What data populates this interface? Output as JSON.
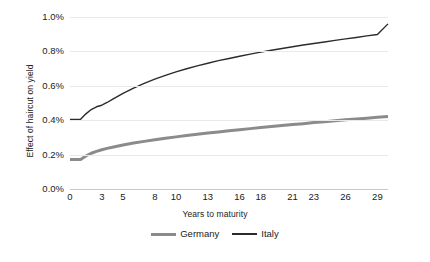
{
  "chart_data": {
    "type": "line",
    "title": "",
    "xlabel": "Years to maturity",
    "ylabel": "Effect of haircut on yield",
    "xlim": [
      0,
      30
    ],
    "ylim": [
      0,
      0.01
    ],
    "grid": true,
    "legend_position": "bottom-center",
    "xticks": [
      "0",
      "3",
      "5",
      "8",
      "10",
      "13",
      "16",
      "18",
      "21",
      "23",
      "26",
      "29"
    ],
    "xtick_values": [
      0,
      3,
      5,
      8,
      10,
      13,
      16,
      18,
      21,
      23,
      26,
      29
    ],
    "yticks": [
      "0.0%",
      "0.2%",
      "0.4%",
      "0.6%",
      "0.8%",
      "1.0%"
    ],
    "ytick_values": [
      0,
      0.002,
      0.004,
      0.006,
      0.008,
      0.01
    ],
    "x": [
      0,
      1,
      1.5,
      2,
      2.5,
      3,
      3.5,
      4,
      5,
      6,
      7,
      8,
      9,
      10,
      11,
      12,
      13,
      14,
      15,
      16,
      17,
      18,
      19,
      20,
      21,
      22,
      23,
      24,
      25,
      26,
      27,
      28,
      29,
      30
    ],
    "series": [
      {
        "name": "Germany",
        "color": "#8b8b8b",
        "width": 3,
        "values": [
          0.00172,
          0.00172,
          0.00192,
          0.00208,
          0.00219,
          0.00228,
          0.00236,
          0.00243,
          0.00256,
          0.00267,
          0.00277,
          0.00286,
          0.00295,
          0.00303,
          0.00311,
          0.00318,
          0.00325,
          0.00332,
          0.00338,
          0.00345,
          0.00351,
          0.00357,
          0.00363,
          0.00369,
          0.00375,
          0.0038,
          0.00386,
          0.00391,
          0.00397,
          0.00402,
          0.00407,
          0.00412,
          0.00417,
          0.00422
        ]
      },
      {
        "name": "Italy",
        "color": "#2b2b2b",
        "width": 1.4,
        "values": [
          0.00405,
          0.00405,
          0.00437,
          0.00462,
          0.00478,
          0.00487,
          0.00503,
          0.00521,
          0.00556,
          0.00587,
          0.00614,
          0.00639,
          0.00661,
          0.00681,
          0.00699,
          0.00716,
          0.00731,
          0.00746,
          0.00759,
          0.00772,
          0.00784,
          0.00796,
          0.00807,
          0.00817,
          0.00827,
          0.00837,
          0.00846,
          0.00855,
          0.00864,
          0.00873,
          0.00881,
          0.0089,
          0.00898,
          0.0096
        ]
      }
    ]
  },
  "legend": {
    "items": [
      {
        "label": "Germany"
      },
      {
        "label": "Italy"
      }
    ]
  }
}
